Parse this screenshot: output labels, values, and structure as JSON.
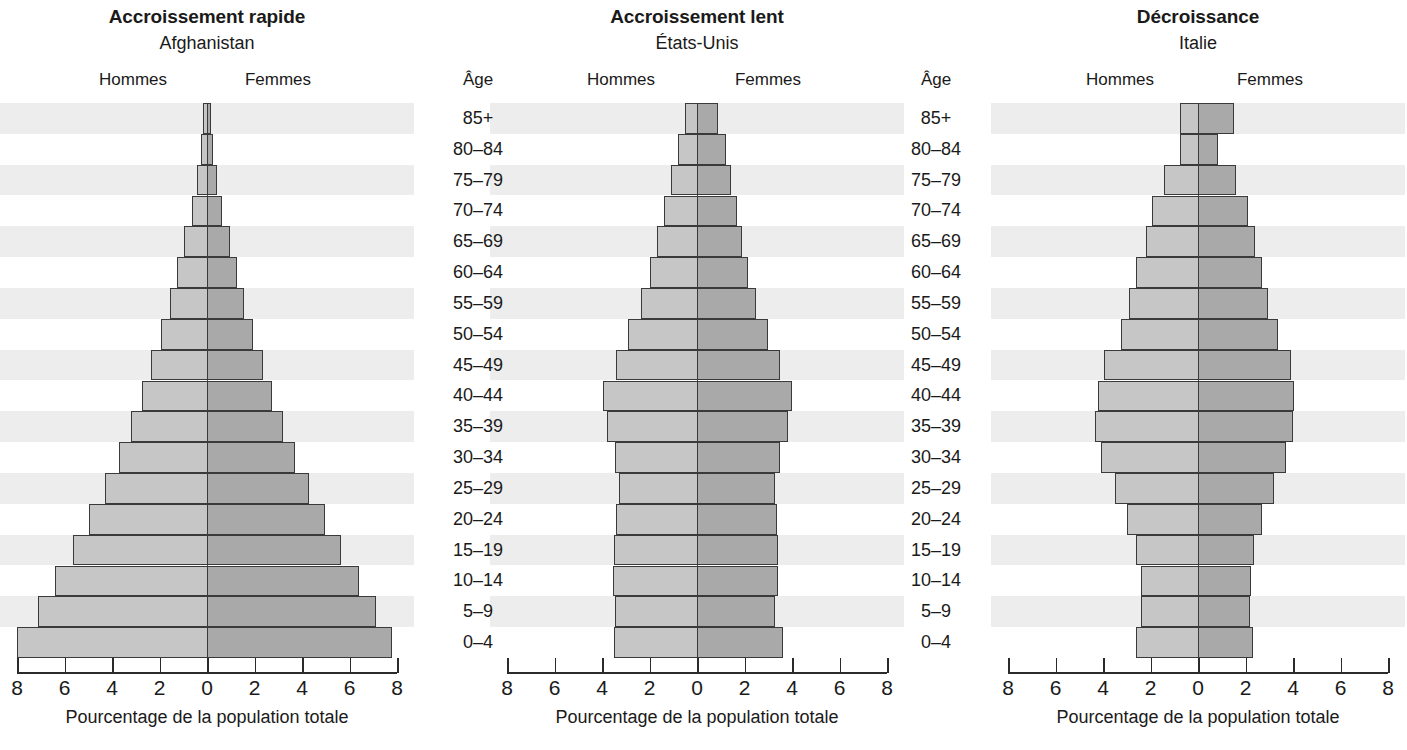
{
  "figure": {
    "x_axis_title": "Pourcentage de la population totale",
    "age_header": "Âge",
    "men_label": "Hommes",
    "women_label": "Femmes",
    "tick_labels": [
      "8",
      "6",
      "4",
      "2",
      "0",
      "2",
      "4",
      "6",
      "8"
    ],
    "age_groups": [
      "85+",
      "80–84",
      "75–79",
      "70–74",
      "65–69",
      "60–64",
      "55–59",
      "50–54",
      "45–49",
      "40–44",
      "35–39",
      "30–34",
      "25–29",
      "20–24",
      "15–19",
      "10–14",
      "5–9",
      "0–4"
    ],
    "colors": {
      "male_bar": "#c6c6c6",
      "female_bar": "#a9a9a9",
      "bar_border": "#3a3a3a",
      "band_stripe": "#ededed",
      "axis": "#2b2b2b",
      "text": "#1a1a1a"
    }
  },
  "chart_data": [
    {
      "type": "bar",
      "title": "Accroissement rapide",
      "subtitle": "Afghanistan",
      "xlabel": "Pourcentage de la population totale",
      "ylabel": "Âge",
      "xlim": [
        -8,
        8
      ],
      "xticks": [
        -8,
        -6,
        -4,
        -2,
        0,
        2,
        4,
        6,
        8
      ],
      "xticklabels": [
        "8",
        "6",
        "4",
        "2",
        "0",
        "2",
        "4",
        "6",
        "8"
      ],
      "grid": false,
      "legend": [
        "Hommes",
        "Femmes"
      ],
      "legend_position": "top",
      "categories": [
        "85+",
        "80–84",
        "75–79",
        "70–74",
        "65–69",
        "60–64",
        "55–59",
        "50–54",
        "45–49",
        "40–44",
        "35–39",
        "30–34",
        "25–29",
        "20–24",
        "15–19",
        "10–14",
        "5–9",
        "0–4"
      ],
      "series": [
        {
          "name": "Hommes",
          "side": "left",
          "values": [
            0.15,
            0.25,
            0.42,
            0.62,
            0.95,
            1.25,
            1.55,
            1.95,
            2.35,
            2.75,
            3.2,
            3.7,
            4.3,
            4.95,
            5.65,
            6.4,
            7.1,
            8.0
          ]
        },
        {
          "name": "Femmes",
          "side": "right",
          "values": [
            0.15,
            0.25,
            0.42,
            0.62,
            0.95,
            1.25,
            1.55,
            1.95,
            2.35,
            2.75,
            3.2,
            3.7,
            4.3,
            4.95,
            5.65,
            6.4,
            7.1,
            7.8
          ]
        }
      ]
    },
    {
      "type": "bar",
      "title": "Accroissement lent",
      "subtitle": "États-Unis",
      "xlabel": "Pourcentage de la population totale",
      "ylabel": "Âge",
      "xlim": [
        -8,
        8
      ],
      "xticks": [
        -8,
        -6,
        -4,
        -2,
        0,
        2,
        4,
        6,
        8
      ],
      "xticklabels": [
        "8",
        "6",
        "4",
        "2",
        "0",
        "2",
        "4",
        "6",
        "8"
      ],
      "grid": false,
      "legend": [
        "Hommes",
        "Femmes"
      ],
      "legend_position": "top",
      "categories": [
        "85+",
        "80–84",
        "75–79",
        "70–74",
        "65–69",
        "60–64",
        "55–59",
        "50–54",
        "45–49",
        "40–44",
        "35–39",
        "30–34",
        "25–29",
        "20–24",
        "15–19",
        "10–14",
        "5–9",
        "0–4"
      ],
      "series": [
        {
          "name": "Hommes",
          "side": "left",
          "values": [
            0.5,
            0.8,
            1.1,
            1.4,
            1.7,
            2.0,
            2.35,
            2.9,
            3.4,
            3.95,
            3.8,
            3.45,
            3.3,
            3.4,
            3.5,
            3.55,
            3.45,
            3.5
          ]
        },
        {
          "name": "Femmes",
          "side": "right",
          "values": [
            0.9,
            1.2,
            1.45,
            1.7,
            1.9,
            2.15,
            2.5,
            3.0,
            3.5,
            4.0,
            3.85,
            3.5,
            3.3,
            3.35,
            3.4,
            3.4,
            3.3,
            3.6
          ]
        }
      ]
    },
    {
      "type": "bar",
      "title": "Décroissance",
      "subtitle": "Italie",
      "xlabel": "Pourcentage de la population totale",
      "ylabel": "Âge",
      "xlim": [
        -8,
        8
      ],
      "xticks": [
        -8,
        -6,
        -4,
        -2,
        0,
        2,
        4,
        6,
        8
      ],
      "xticklabels": [
        "8",
        "6",
        "4",
        "2",
        "0",
        "2",
        "4",
        "6",
        "8"
      ],
      "grid": false,
      "legend": [
        "Hommes",
        "Femmes"
      ],
      "legend_position": "top",
      "categories": [
        "85+",
        "80–84",
        "75–79",
        "70–74",
        "65–69",
        "60–64",
        "55–59",
        "50–54",
        "45–49",
        "40–44",
        "35–39",
        "30–34",
        "25–29",
        "20–24",
        "15–19",
        "10–14",
        "5–9",
        "0–4"
      ],
      "series": [
        {
          "name": "Hommes",
          "side": "left",
          "values": [
            0.75,
            0.75,
            1.45,
            1.95,
            2.2,
            2.6,
            2.9,
            3.25,
            3.95,
            4.2,
            4.35,
            4.1,
            3.5,
            3.0,
            2.6,
            2.4,
            2.4,
            2.6
          ]
        },
        {
          "name": "Femmes",
          "side": "right",
          "values": [
            1.5,
            0.85,
            1.6,
            2.1,
            2.4,
            2.7,
            2.95,
            3.35,
            3.9,
            4.05,
            4.0,
            3.7,
            3.2,
            2.7,
            2.35,
            2.25,
            2.2,
            2.3
          ]
        }
      ]
    }
  ],
  "panels": [
    {
      "center_x": 207,
      "left_x": 10,
      "right_x": 404,
      "unit": 23.75,
      "men_x": 133,
      "women_x": 278
    },
    {
      "center_x": 697,
      "left_x": 500,
      "right_x": 894,
      "unit": 23.75,
      "men_x": 621,
      "women_x": 768
    },
    {
      "center_x": 1198,
      "left_x": 1001,
      "right_x": 1395,
      "unit": 23.75,
      "men_x": 1120,
      "women_x": 1270
    }
  ],
  "age_columns": [
    {
      "x": 478,
      "header_x": 478
    },
    {
      "x": 936,
      "header_x": 936
    }
  ]
}
